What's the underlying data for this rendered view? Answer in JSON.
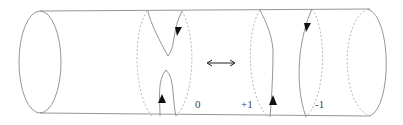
{
  "diagram": {
    "labels": {
      "left_config": "0",
      "right_config_a": "+1",
      "right_config_b": "-1"
    },
    "equivalence_symbol": "double-headed-arrow",
    "colors": {
      "outline": "#8a8a8a",
      "hidden_edge": "#b0b0b0",
      "arrow": "#111111",
      "text": "#444444"
    }
  }
}
